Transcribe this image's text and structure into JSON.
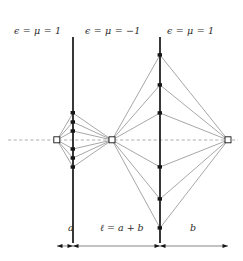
{
  "figure": {
    "regions": [
      {
        "id": "left-vacuum",
        "label": "ϵ = μ = 1"
      },
      {
        "id": "slab-negative",
        "label": "ϵ = μ = −1"
      },
      {
        "id": "right-vacuum",
        "label": "ϵ = μ = 1"
      }
    ],
    "dimensions": [
      {
        "id": "a",
        "label": "a"
      },
      {
        "id": "l",
        "label": "ℓ = a + b"
      },
      {
        "id": "b",
        "label": "b"
      }
    ],
    "colors": {
      "ray": "#8a8a8a",
      "interface": "#151515",
      "axis": "#9a9a9a",
      "node": "#151515",
      "text": "#2b2b2b",
      "background": "#ffffff"
    },
    "geometry": {
      "axis_y": 140,
      "interface1_x": 73,
      "interface2_x": 160,
      "source_x": 57,
      "focus_internal_x": 112,
      "focus_external_x": 228,
      "dim_line_y": 246,
      "dim_left_x": 57,
      "dim_right_x": 228
    }
  }
}
